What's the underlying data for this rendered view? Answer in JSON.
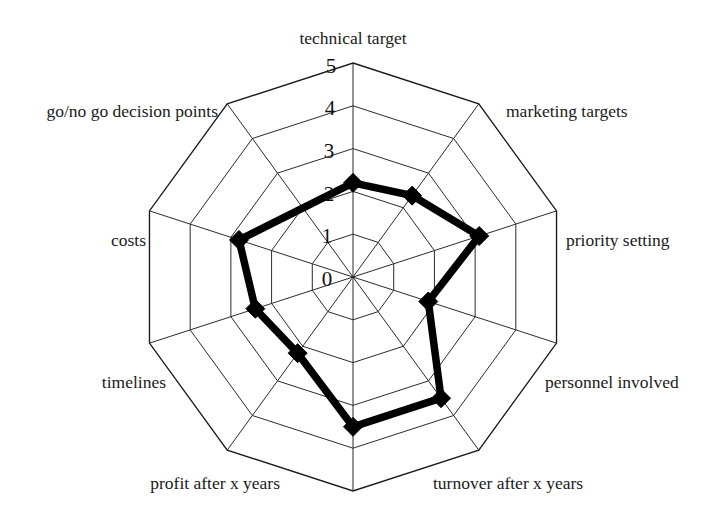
{
  "chart_data": {
    "type": "radar",
    "title": "",
    "subtitle": "",
    "xlabel": "",
    "ylabel": "",
    "grid": true,
    "legend": "none",
    "radial_axis": {
      "min": 0,
      "max": 5,
      "ticks": [
        "0",
        "1",
        "2",
        "3",
        "4",
        "5"
      ],
      "tick_values": [
        0,
        1,
        2,
        3,
        4,
        5
      ],
      "tick_axis": "technical target",
      "rings": 5
    },
    "categories": [
      "technical target",
      "marketing targets",
      "priority setting",
      "personnel involved",
      "turnover after x years",
      "profit after x years",
      "timelines",
      "costs",
      "go/no go decision points"
    ],
    "series": [
      {
        "name": "",
        "marker": "diamond",
        "color": "#000000",
        "values": [
          2.2,
          2.35,
          3.1,
          1.85,
          3.5,
          3.5,
          2.2,
          2.4,
          2.8
        ]
      }
    ]
  },
  "labels": {
    "technical_target": "technical target",
    "marketing_targets": "marketing targets",
    "priority_setting": "priority setting",
    "personnel_involved": "personnel involved",
    "turnover_after_x_years": "turnover after x years",
    "profit_after_x_years": "profit after x years",
    "timelines": "timelines",
    "costs": "costs",
    "go_no_go_decision_points": "go/no go decision points"
  },
  "ticks": {
    "t0": "0",
    "t1": "1",
    "t2": "2",
    "t3": "3",
    "t4": "4",
    "t5": "5"
  },
  "colors": {
    "series": "#000000",
    "grid": "#2b2b2b",
    "background": "#ffffff",
    "text": "#1a1a1a"
  }
}
